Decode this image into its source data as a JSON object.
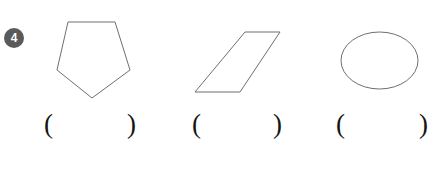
{
  "question": {
    "number": "4",
    "badge_color": "#5a5a5a",
    "badge_text_color": "#ffffff"
  },
  "colors": {
    "background": "#ffffff",
    "shape_outline": "#6f6f72",
    "text": "#141414"
  },
  "shapes": [
    {
      "name": "pentagon",
      "icon": "pentagon-shape",
      "orientation": "point-down",
      "points": "68,22 115,22 130,70 92,98 57,70"
    },
    {
      "name": "parallelogram",
      "icon": "parallelogram-shape",
      "orientation": "slanted-right",
      "points": "245,32 280,32 240,92 195,92"
    },
    {
      "name": "ellipse",
      "icon": "ellipse-shape",
      "orientation": "horizontal",
      "cx": "379.5",
      "cy": "60.5",
      "rx": "38.5",
      "ry": "28.5"
    }
  ],
  "answers": [
    {
      "open": "(",
      "value": "",
      "close": ")"
    },
    {
      "open": "(",
      "value": "",
      "close": ")"
    },
    {
      "open": "(",
      "value": "",
      "close": ")"
    }
  ]
}
